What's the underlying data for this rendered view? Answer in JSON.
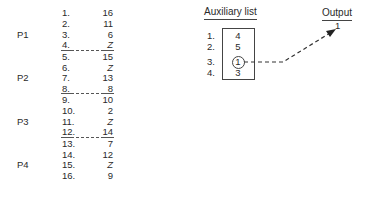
{
  "main_list": {
    "rows": [
      {
        "index": "1.",
        "value": "16"
      },
      {
        "index": "2.",
        "value": "11"
      },
      {
        "index": "3.",
        "value": "6"
      },
      {
        "index": "4.",
        "value": "Z"
      },
      {
        "index": "5.",
        "value": "15"
      },
      {
        "index": "6.",
        "value": "Z"
      },
      {
        "index": "7.",
        "value": "13"
      },
      {
        "index": "8.",
        "value": "8"
      },
      {
        "index": "9.",
        "value": "10"
      },
      {
        "index": "10.",
        "value": "2"
      },
      {
        "index": "11.",
        "value": "Z"
      },
      {
        "index": "12.",
        "value": "14"
      },
      {
        "index": "13.",
        "value": "7"
      },
      {
        "index": "14.",
        "value": "12"
      },
      {
        "index": "15.",
        "value": "Z"
      },
      {
        "index": "16.",
        "value": "9"
      }
    ],
    "groups": [
      {
        "label": "P1"
      },
      {
        "label": "P2"
      },
      {
        "label": "P3"
      },
      {
        "label": "P4"
      }
    ]
  },
  "auxiliary_list": {
    "title": "Auxiliary list",
    "items": [
      {
        "index": "1.",
        "value": "4"
      },
      {
        "index": "2.",
        "value": "5"
      },
      {
        "index": "3.",
        "value": "1",
        "circled": true
      },
      {
        "index": "4.",
        "value": "3"
      }
    ]
  },
  "output": {
    "title": "Output",
    "value": "1"
  },
  "colors": {
    "ink": "#2a2a2a",
    "background": "#ffffff"
  }
}
